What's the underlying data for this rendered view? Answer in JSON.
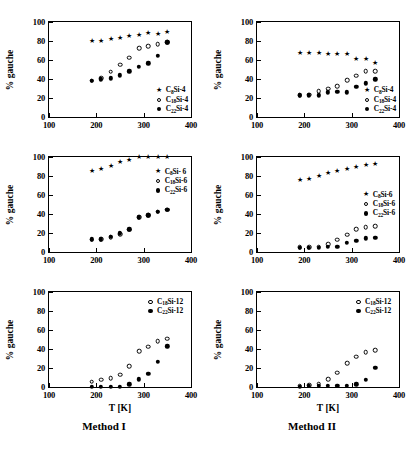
{
  "figure": {
    "columns": [
      {
        "caption": "Method I"
      },
      {
        "caption": "Method II"
      }
    ],
    "axis_titles": {
      "y": "% gauche",
      "x": "T [K]"
    }
  },
  "chart_data": [
    {
      "id": "panel-1-1",
      "type": "scatter",
      "title": "",
      "xlabel": "T [K]",
      "ylabel": "% gauche",
      "xlim": [
        100,
        400
      ],
      "ylim": [
        0,
        100
      ],
      "xticks": [
        100,
        200,
        300,
        400
      ],
      "yticks": [
        0,
        20,
        40,
        60,
        80,
        100
      ],
      "grid": false,
      "legend_position": "bottom-right",
      "series": [
        {
          "name": "C8Si-4",
          "label": "C_8Si-4",
          "marker": "star",
          "x": [
            190,
            210,
            230,
            250,
            270,
            290,
            310,
            330,
            350
          ],
          "y": [
            79.5,
            80.3,
            82.0,
            83.2,
            84.8,
            86.3,
            88.2,
            87.3,
            89.0
          ]
        },
        {
          "name": "C18Si-4",
          "label": "C_18Si-4",
          "marker": "open-circle",
          "x": [
            190,
            210,
            230,
            250,
            270,
            290,
            310,
            330,
            350
          ],
          "y": [
            38.3,
            41.0,
            47.5,
            55.2,
            62.5,
            72.7,
            74.5,
            76.7,
            79.0
          ]
        },
        {
          "name": "C22Si-4",
          "label": "C_22Si-4",
          "marker": "filled-circle",
          "x": [
            190,
            210,
            230,
            250,
            270,
            290,
            310,
            330,
            350
          ],
          "y": [
            38.0,
            39.8,
            40.7,
            43.8,
            48.2,
            52.8,
            56.5,
            64.5,
            78.5
          ]
        }
      ]
    },
    {
      "id": "panel-1-2",
      "type": "scatter",
      "title": "",
      "xlabel": "T [K]",
      "ylabel": "% gauche",
      "xlim": [
        100,
        400
      ],
      "ylim": [
        0,
        100
      ],
      "xticks": [
        100,
        200,
        300,
        400
      ],
      "yticks": [
        0,
        20,
        40,
        60,
        80,
        100
      ],
      "grid": false,
      "legend_position": "bottom-right",
      "series": [
        {
          "name": "C8Si-4",
          "label": "C_8Si-4",
          "marker": "star",
          "x": [
            190,
            210,
            230,
            250,
            270,
            290,
            310,
            330,
            350
          ],
          "y": [
            67.5,
            67.5,
            67.0,
            66.5,
            66.0,
            66.0,
            61.5,
            61.5,
            57.0
          ]
        },
        {
          "name": "C18Si-4",
          "label": "C_18Si-4",
          "marker": "open-circle",
          "x": [
            190,
            210,
            230,
            250,
            270,
            290,
            310,
            330,
            350
          ],
          "y": [
            23.0,
            23.5,
            27.0,
            30.0,
            32.5,
            38.5,
            43.5,
            48.5,
            48.5
          ]
        },
        {
          "name": "C22Si-4",
          "label": "C_22Si-4",
          "marker": "filled-circle",
          "x": [
            190,
            210,
            230,
            250,
            270,
            290,
            310,
            330,
            350
          ],
          "y": [
            23.0,
            23.0,
            23.0,
            26.0,
            26.5,
            26.0,
            31.5,
            35.5,
            39.5
          ]
        }
      ]
    },
    {
      "id": "panel-2-1",
      "type": "scatter",
      "title": "",
      "xlabel": "T [K]",
      "ylabel": "% gauche",
      "xlim": [
        100,
        400
      ],
      "ylim": [
        0,
        100
      ],
      "xticks": [
        100,
        200,
        300,
        400
      ],
      "yticks": [
        0,
        20,
        40,
        60,
        80,
        100
      ],
      "grid": false,
      "legend_position": "upper-right",
      "series": [
        {
          "name": "C8Si-6",
          "label": "C_8Si- 6",
          "marker": "star",
          "x": [
            190,
            210,
            230,
            250,
            270,
            290,
            310,
            330,
            350
          ],
          "y": [
            85.0,
            87.0,
            90.5,
            95.0,
            97.0,
            99.5,
            99.8,
            99.8,
            99.8
          ]
        },
        {
          "name": "C18Si-6",
          "label": "C_18Si-6",
          "marker": "open-circle",
          "x": [
            190,
            210,
            230,
            250,
            270,
            290,
            310,
            330,
            350
          ],
          "y": [
            13.0,
            13.5,
            15.5,
            19.0,
            23.5,
            36.5,
            39.0,
            42.5,
            44.5
          ]
        },
        {
          "name": "C22Si-6",
          "label": "C_22Si-6",
          "marker": "filled-circle",
          "x": [
            190,
            210,
            230,
            250,
            270,
            290,
            310,
            330,
            350
          ],
          "y": [
            13.5,
            13.5,
            16.0,
            19.5,
            24.0,
            36.5,
            38.5,
            42.5,
            44.5
          ]
        }
      ]
    },
    {
      "id": "panel-2-2",
      "type": "scatter",
      "title": "",
      "xlabel": "T [K]",
      "ylabel": "% gauche",
      "xlim": [
        100,
        400
      ],
      "ylim": [
        0,
        100
      ],
      "xticks": [
        100,
        200,
        300,
        400
      ],
      "yticks": [
        0,
        20,
        40,
        60,
        80,
        100
      ],
      "grid": false,
      "legend_position": "middle-right",
      "series": [
        {
          "name": "C8Si-6",
          "label": "C_8Si-6",
          "marker": "star",
          "x": [
            190,
            210,
            230,
            250,
            270,
            290,
            310,
            330,
            350
          ],
          "y": [
            75.5,
            77.0,
            80.5,
            83.5,
            85.5,
            87.5,
            90.0,
            92.0,
            92.5
          ]
        },
        {
          "name": "C18Si-6",
          "label": "C_18Si-6",
          "marker": "open-circle",
          "x": [
            190,
            210,
            230,
            250,
            270,
            290,
            310,
            330,
            350
          ],
          "y": [
            5.0,
            5.0,
            5.5,
            8.0,
            13.0,
            18.0,
            24.0,
            26.0,
            27.0
          ]
        },
        {
          "name": "C22Si-6",
          "label": "C_22Si-6",
          "marker": "filled-circle",
          "x": [
            190,
            210,
            230,
            250,
            270,
            290,
            310,
            330,
            350
          ],
          "y": [
            4.5,
            4.5,
            4.5,
            5.5,
            5.5,
            9.5,
            11.5,
            14.5,
            15.0
          ]
        }
      ]
    },
    {
      "id": "panel-3-1",
      "type": "scatter",
      "title": "",
      "xlabel": "T [K]",
      "ylabel": "% gauche",
      "xlim": [
        100,
        400
      ],
      "ylim": [
        0,
        100
      ],
      "xticks": [
        100,
        200,
        300,
        400
      ],
      "yticks": [
        0,
        20,
        40,
        60,
        80,
        100
      ],
      "grid": false,
      "legend_position": "upper-right",
      "series": [
        {
          "name": "C18Si-12",
          "label": "C_18Si-12",
          "marker": "open-circle",
          "x": [
            190,
            210,
            230,
            250,
            270,
            290,
            310,
            330,
            350
          ],
          "y": [
            5.5,
            7.5,
            9.5,
            13.0,
            22.0,
            37.5,
            42.5,
            48.0,
            51.0
          ]
        },
        {
          "name": "C22Si-12",
          "label": "C_22Si-12",
          "marker": "filled-circle",
          "x": [
            190,
            210,
            230,
            250,
            270,
            290,
            310,
            330,
            350
          ],
          "y": [
            0.5,
            0.5,
            0.5,
            0.5,
            3.0,
            8.0,
            14.0,
            26.5,
            43.0
          ]
        }
      ]
    },
    {
      "id": "panel-3-2",
      "type": "scatter",
      "title": "",
      "xlabel": "T [K]",
      "ylabel": "% gauche",
      "xlim": [
        100,
        400
      ],
      "ylim": [
        0,
        100
      ],
      "xticks": [
        100,
        200,
        300,
        400
      ],
      "yticks": [
        0,
        20,
        40,
        60,
        80,
        100
      ],
      "grid": false,
      "legend_position": "upper-right",
      "series": [
        {
          "name": "C18Si-12",
          "label": "C_18Si-12",
          "marker": "open-circle",
          "x": [
            190,
            210,
            230,
            250,
            270,
            290,
            310,
            330,
            350
          ],
          "y": [
            1.5,
            2.0,
            3.5,
            8.0,
            15.0,
            25.0,
            32.0,
            36.5,
            38.5
          ]
        },
        {
          "name": "C22Si-12",
          "label": "C_22Si-12",
          "marker": "filled-circle",
          "x": [
            190,
            210,
            230,
            250,
            270,
            290,
            310,
            330,
            350
          ],
          "y": [
            0.5,
            1.0,
            1.5,
            1.5,
            1.5,
            1.5,
            3.0,
            7.5,
            20.0
          ]
        }
      ]
    }
  ]
}
